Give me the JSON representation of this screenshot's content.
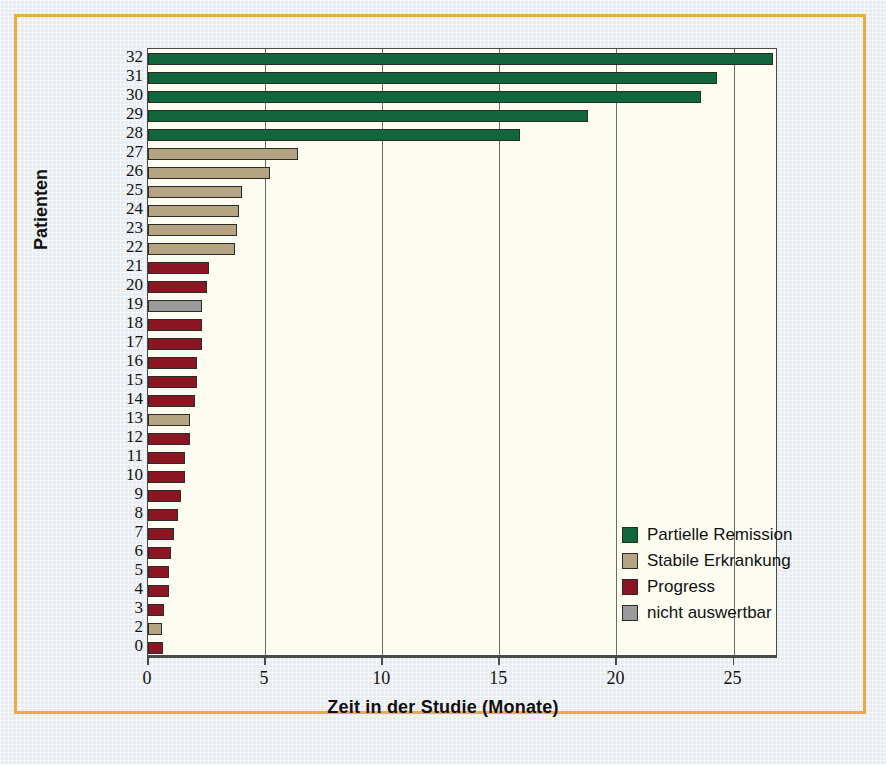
{
  "figure": {
    "border_color": "#e8ae3c",
    "plot_background": "#fdfcf1",
    "page_background": "#e8ecf2"
  },
  "legend": {
    "position": "inside-bottom-right",
    "items": [
      {
        "label": "Partielle Remission",
        "color": "#11663d",
        "swatch": "legend-swatch-green"
      },
      {
        "label": "Stabile Erkrankung",
        "color": "#b5a482",
        "swatch": "legend-swatch-tan"
      },
      {
        "label": "Progress",
        "color": "#8b1520",
        "swatch": "legend-swatch-red"
      },
      {
        "label": "nicht auswertbar",
        "color": "#9a9a9a",
        "swatch": "legend-swatch-gray"
      }
    ]
  },
  "chart_data": {
    "type": "bar",
    "orientation": "horizontal",
    "title": "",
    "xlabel": "Zeit in der Studie (Monate)",
    "ylabel": "Patienten",
    "xlim": [
      0,
      26.7
    ],
    "xticks": [
      0,
      5,
      10,
      15,
      20,
      25
    ],
    "xtick_labels": [
      "0",
      "5",
      "10",
      "15",
      "20",
      "25"
    ],
    "grid": "vertical",
    "legend_position": "inside-bottom-right",
    "category_colors": {
      "Partielle Remission": "#11663d",
      "Stabile Erkrankung": "#b5a482",
      "Progress": "#8b1520",
      "nicht auswertbar": "#9a9a9a"
    },
    "categories": [
      "32",
      "31",
      "30",
      "29",
      "28",
      "27",
      "26",
      "25",
      "24",
      "23",
      "22",
      "21",
      "20",
      "19",
      "18",
      "17",
      "16",
      "15",
      "14",
      "13",
      "12",
      "11",
      "10",
      "9",
      "8",
      "7",
      "6",
      "5",
      "4",
      "3",
      "2",
      "0"
    ],
    "values": [
      26.7,
      24.3,
      23.6,
      18.8,
      15.9,
      6.4,
      5.2,
      4.0,
      3.9,
      3.8,
      3.7,
      2.6,
      2.5,
      2.3,
      2.3,
      2.3,
      2.1,
      2.1,
      2.0,
      1.8,
      1.8,
      1.6,
      1.6,
      1.4,
      1.3,
      1.1,
      1.0,
      0.9,
      0.9,
      0.7,
      0.6,
      0.65
    ],
    "response": [
      "Partielle Remission",
      "Partielle Remission",
      "Partielle Remission",
      "Partielle Remission",
      "Partielle Remission",
      "Stabile Erkrankung",
      "Stabile Erkrankung",
      "Stabile Erkrankung",
      "Stabile Erkrankung",
      "Stabile Erkrankung",
      "Stabile Erkrankung",
      "Progress",
      "Progress",
      "nicht auswertbar",
      "Progress",
      "Progress",
      "Progress",
      "Progress",
      "Progress",
      "Stabile Erkrankung",
      "Progress",
      "Progress",
      "Progress",
      "Progress",
      "Progress",
      "Progress",
      "Progress",
      "Progress",
      "Progress",
      "Progress",
      "Stabile Erkrankung",
      "Progress"
    ]
  }
}
